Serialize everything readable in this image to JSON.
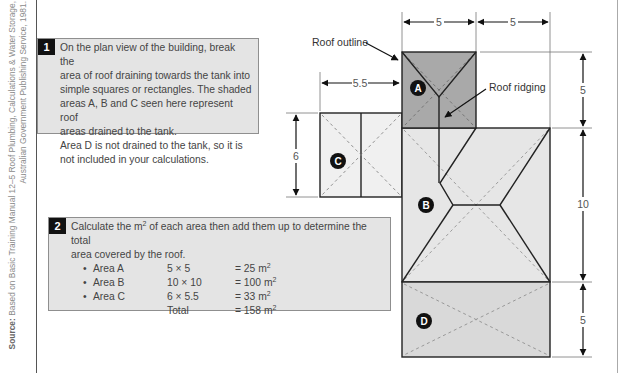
{
  "source": {
    "label": "Source:",
    "line1": " Based on Basic Training Manual 12–5 Roof Plumbing, Calculations & Water Storage,",
    "line2": "Australian Government Publishing Service, 1981."
  },
  "step1": {
    "number": "1",
    "text_lines": [
      "On the plan view of the building, break the",
      "area of roof draining towards the tank into",
      "simple squares or rectangles. The shaded",
      "areas A, B and C seen here represent roof",
      "areas drained to the tank.",
      "Area D is not drained to the tank, so it is",
      "not included in your calculations."
    ]
  },
  "step2": {
    "number": "2",
    "text_line1_pre": "Calculate the m",
    "text_line1_sup": "2",
    "text_line1_post": " of each area then add them up to determine the total",
    "text_line2": "area covered by the roof.",
    "rows": [
      {
        "label": "Area A",
        "formula": "5 × 5",
        "result": "= 25 m",
        "sup": "2",
        "bullet": true
      },
      {
        "label": "Area B",
        "formula": "10 × 10",
        "result": "= 100 m",
        "sup": "2",
        "bullet": true
      },
      {
        "label": "Area C",
        "formula": "6 × 5.5",
        "result": "= 33  m",
        "sup": "2",
        "bullet": true
      },
      {
        "label": "",
        "formula": "Total",
        "result": "= 158 m",
        "sup": "2",
        "bullet": false
      }
    ]
  },
  "diagram": {
    "annotations": {
      "roof_outline": "Roof outline",
      "roof_ridging": "Roof ridging"
    },
    "areas": [
      {
        "id": "A",
        "label": "A",
        "width": 5,
        "depth": 5,
        "drained": true,
        "fill": "#a9a9a9"
      },
      {
        "id": "B",
        "label": "B",
        "width": 10,
        "depth": 10,
        "drained": true,
        "fill": "#e6e6e6"
      },
      {
        "id": "C",
        "label": "C",
        "width": 5.5,
        "depth": 6,
        "drained": true,
        "fill": "#efefef"
      },
      {
        "id": "D",
        "label": "D",
        "width": 10,
        "depth": 5,
        "drained": false,
        "fill": "#d9d9d9"
      }
    ],
    "dimensions": {
      "top_left": "5",
      "top_right": "5",
      "c_width": "5.5",
      "c_height": "6",
      "right_a": "5",
      "right_b": "10",
      "right_d": "5"
    }
  }
}
